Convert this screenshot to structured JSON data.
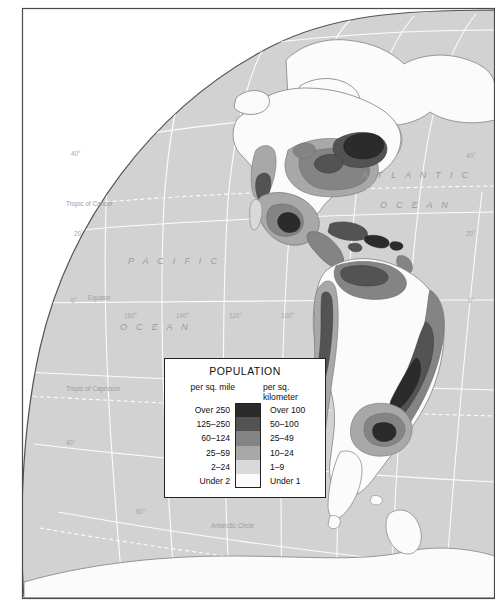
{
  "map": {
    "title": "Population Density of the Americas",
    "projection": "globe-hemisphere",
    "colors": {
      "ocean": "#d2d2d2",
      "land_under2": "#fbfbfb",
      "outline": "#6e6e6e",
      "graticule": "#ffffff",
      "border": "#4a4a4a",
      "page_background": "#ffffff"
    },
    "ocean_labels": [
      {
        "name": "pacific-ocean-label-line1",
        "text": "P A C I F I C",
        "x": 128,
        "y": 262
      },
      {
        "name": "pacific-ocean-label-line2",
        "text": "O C E A N",
        "x": 120,
        "y": 328
      },
      {
        "name": "atlantic-ocean-label-line1",
        "text": "A T L A N T I C",
        "x": 368,
        "y": 176
      },
      {
        "name": "atlantic-ocean-label-line2",
        "text": "O C E A N",
        "x": 383,
        "y": 206
      }
    ],
    "reference_lines": [
      {
        "name": "tropic-of-cancer-label",
        "text": "Tropic of Cancer",
        "x": 66,
        "y": 205
      },
      {
        "name": "equator-label",
        "text": "Equator",
        "x": 88,
        "y": 297
      },
      {
        "name": "tropic-of-capricorn-label",
        "text": "Tropic of Capricorn",
        "x": 66,
        "y": 390
      },
      {
        "name": "antarctic-circle-label",
        "text": "Antarctic Circle",
        "x": 211,
        "y": 527
      }
    ],
    "latitude_labels": [
      {
        "text": "40°",
        "x": 71,
        "y": 155
      },
      {
        "text": "20°",
        "x": 74,
        "y": 235
      },
      {
        "text": "0°",
        "x": 71,
        "y": 302
      },
      {
        "text": "40°",
        "x": 66,
        "y": 444
      },
      {
        "text": "60°",
        "x": 136,
        "y": 513
      },
      {
        "text": "40°",
        "x": 466,
        "y": 157
      },
      {
        "text": "20°",
        "x": 466,
        "y": 235
      },
      {
        "text": "0°",
        "x": 468,
        "y": 302
      }
    ],
    "longitude_labels": [
      {
        "text": "160°",
        "x": 124,
        "y": 317
      },
      {
        "text": "140°",
        "x": 176,
        "y": 317
      },
      {
        "text": "120°",
        "x": 229,
        "y": 317
      },
      {
        "text": "100°",
        "x": 281,
        "y": 317
      }
    ]
  },
  "legend": {
    "title": "POPULATION",
    "header_left": "per sq. mile",
    "header_right": "per sq. kilometer",
    "rows": [
      {
        "mile": "Over 250",
        "km": "Over 100",
        "color": "#2b2b2b"
      },
      {
        "mile": "125–250",
        "km": "50–100",
        "color": "#535353"
      },
      {
        "mile": "60–124",
        "km": "25–49",
        "color": "#848484"
      },
      {
        "mile": "25–59",
        "km": "10–24",
        "color": "#a8a8a8"
      },
      {
        "mile": "2–24",
        "km": "1–9",
        "color": "#d9d9d9"
      },
      {
        "mile": "Under 2",
        "km": "Under 1",
        "color": "#fbfbfb"
      }
    ]
  }
}
